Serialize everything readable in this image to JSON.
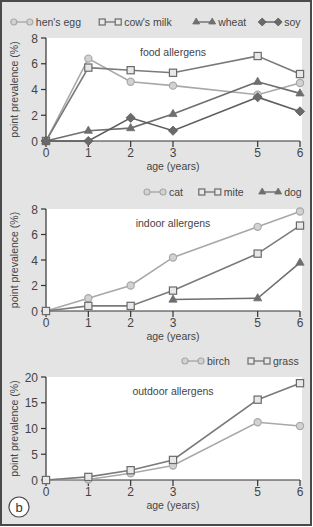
{
  "figure": {
    "panel_label": "b",
    "background": "#e4e4e4",
    "border_color": "#4a4a4a",
    "plot_bg": "#ffffff"
  },
  "chart_data": [
    {
      "type": "line",
      "title": "food allergens",
      "xlabel": "age (years)",
      "ylabel": "point prevalence (%)",
      "x": [
        0,
        1,
        2,
        3,
        5,
        6
      ],
      "x_ticks": [
        0,
        1,
        2,
        3,
        5,
        6
      ],
      "y_ticks": [
        0,
        2,
        4,
        6,
        8
      ],
      "ylim": [
        0,
        8
      ],
      "xlim": [
        0,
        6
      ],
      "grid": false,
      "legend_position": "top-right, above plot",
      "series": [
        {
          "name": "hen's egg",
          "marker": "circle",
          "color": "#a8a8a8",
          "values": [
            0,
            6.4,
            4.6,
            4.3,
            3.6,
            4.5
          ]
        },
        {
          "name": "cow's milk",
          "marker": "square",
          "color": "#7a7a7a",
          "values": [
            0,
            5.7,
            5.5,
            5.3,
            6.6,
            5.2
          ]
        },
        {
          "name": "wheat",
          "marker": "triangle",
          "color": "#6e6e6e",
          "values": [
            0,
            0.8,
            1.0,
            2.1,
            4.6,
            3.7
          ]
        },
        {
          "name": "soy",
          "marker": "diamond",
          "color": "#5e5e5e",
          "values": [
            0,
            0,
            1.8,
            0.8,
            3.4,
            2.3
          ]
        }
      ]
    },
    {
      "type": "line",
      "title": "indoor allergens",
      "xlabel": "age (years)",
      "ylabel": "point prevalence (%)",
      "x": [
        0,
        1,
        2,
        3,
        5,
        6
      ],
      "x_ticks": [
        0,
        1,
        2,
        3,
        5,
        6
      ],
      "y_ticks": [
        0,
        2,
        4,
        6,
        8
      ],
      "ylim": [
        0,
        8
      ],
      "xlim": [
        0,
        6
      ],
      "grid": false,
      "legend_position": "top-right, above plot",
      "series": [
        {
          "name": "cat",
          "marker": "circle",
          "color": "#a8a8a8",
          "values": [
            0,
            1.0,
            2.0,
            4.2,
            6.6,
            7.8
          ]
        },
        {
          "name": "mite",
          "marker": "square",
          "color": "#7a7a7a",
          "values": [
            0,
            0.4,
            0.4,
            1.6,
            4.5,
            6.7
          ]
        },
        {
          "name": "dog",
          "marker": "triangle",
          "color": "#6e6e6e",
          "values": [
            null,
            null,
            null,
            0.9,
            1.0,
            3.8
          ]
        }
      ]
    },
    {
      "type": "line",
      "title": "outdoor allergens",
      "xlabel": "age (years)",
      "ylabel": "point prevalence (%)",
      "x": [
        0,
        1,
        2,
        3,
        5,
        6
      ],
      "x_ticks": [
        0,
        1,
        2,
        3,
        5,
        6
      ],
      "y_ticks": [
        0,
        5,
        10,
        15,
        20
      ],
      "ylim": [
        0,
        20
      ],
      "xlim": [
        0,
        6
      ],
      "grid": false,
      "legend_position": "top-right, above plot",
      "series": [
        {
          "name": "birch",
          "marker": "circle",
          "color": "#a8a8a8",
          "values": [
            0,
            0.1,
            1.3,
            2.8,
            11.2,
            10.5
          ]
        },
        {
          "name": "grass",
          "marker": "square",
          "color": "#7a7a7a",
          "values": [
            0,
            0.6,
            1.9,
            3.9,
            15.6,
            18.8
          ]
        }
      ]
    }
  ]
}
